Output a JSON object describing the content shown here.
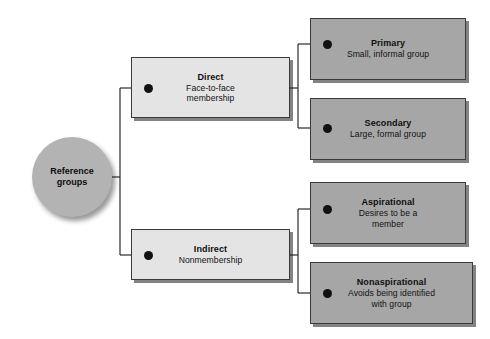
{
  "diagram": {
    "root": {
      "label": "Reference\ngroups"
    },
    "branches": [
      {
        "id": "direct",
        "title": "Direct",
        "subtitle": "Face-to-face\nmembership",
        "children": [
          {
            "id": "primary",
            "title": "Primary",
            "subtitle": "Small, informal group"
          },
          {
            "id": "secondary",
            "title": "Secondary",
            "subtitle": "Large, formal group"
          }
        ]
      },
      {
        "id": "indirect",
        "title": "Indirect",
        "subtitle": "Nonmembership",
        "children": [
          {
            "id": "aspirational",
            "title": "Aspirational",
            "subtitle": "Desires to be a\nmember"
          },
          {
            "id": "nonaspirational",
            "title": "Nonaspirational",
            "subtitle": "Avoids being identified\nwith group"
          }
        ]
      }
    ],
    "colors": {
      "background": "#ffffff",
      "root_fill": "#b3b3b3",
      "level1_fill": "#e4e4e4",
      "level2_fill": "#a6a6a6",
      "border": "#3a3a3a",
      "connector": "#2b2b2b",
      "bullet": "#111111",
      "text": "#0f0f0f"
    }
  }
}
